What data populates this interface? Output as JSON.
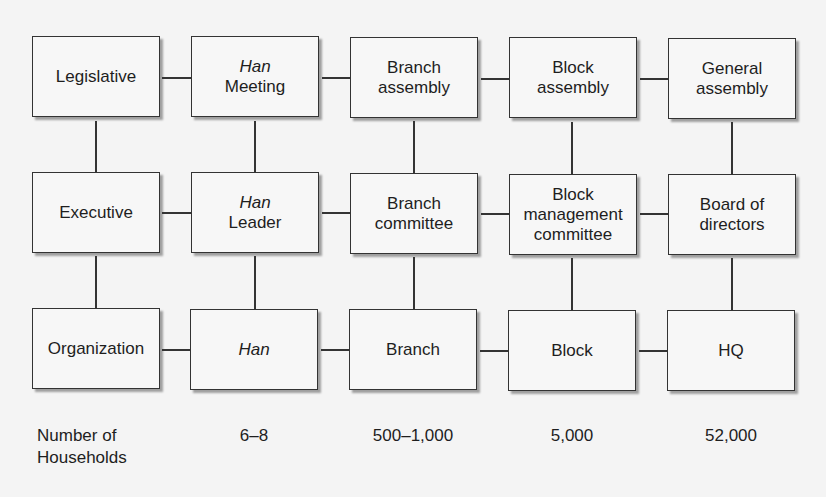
{
  "diagram": {
    "rows": [
      {
        "id": "legislative",
        "cells": [
          {
            "line1": "",
            "line1_italic": "",
            "line2": "Legislative"
          },
          {
            "line1": "",
            "line1_italic": "Han",
            "line2": "Meeting"
          },
          {
            "line1": "Branch",
            "line1_italic": "",
            "line2": "assembly"
          },
          {
            "line1": "Block",
            "line1_italic": "",
            "line2": "assembly"
          },
          {
            "line1": "General",
            "line1_italic": "",
            "line2": "assembly"
          }
        ]
      },
      {
        "id": "executive",
        "cells": [
          {
            "line1": "",
            "line1_italic": "",
            "line2": "Executive"
          },
          {
            "line1": "",
            "line1_italic": "Han",
            "line2": "Leader"
          },
          {
            "line1": "Branch",
            "line1_italic": "",
            "line2": "committee"
          },
          {
            "line1": "Block",
            "line1_italic": "",
            "line2": "management",
            "line3": "committee"
          },
          {
            "line1": "Board of",
            "line1_italic": "",
            "line2": "directors"
          }
        ]
      },
      {
        "id": "organization",
        "cells": [
          {
            "line1": "",
            "line1_italic": "",
            "line2": "Organization"
          },
          {
            "line1": "",
            "line1_italic": "Han",
            "line2": ""
          },
          {
            "line1": "",
            "line1_italic": "",
            "line2": "Branch"
          },
          {
            "line1": "",
            "line1_italic": "",
            "line2": "Block"
          },
          {
            "line1": "",
            "line1_italic": "",
            "line2": "HQ"
          }
        ]
      }
    ],
    "footer": {
      "label_line1": "Number of",
      "label_line2": "Households",
      "values": [
        "6–8",
        "500–1,000",
        "5,000",
        "52,000"
      ]
    },
    "colors": {
      "background": "#f4f4f4",
      "box_fill": "#f7f7f7",
      "line": "#333333",
      "text": "#1e1e1e"
    }
  }
}
